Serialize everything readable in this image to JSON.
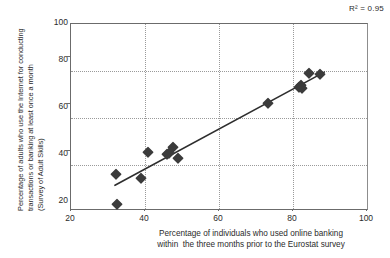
{
  "annotation": {
    "r2_prefix": "R",
    "r2_sup": "2",
    "r2_value": " = 0.95",
    "r2_full": "R² = 0.95"
  },
  "axes": {
    "y_title_lines": [
      "Percentage of adults who use the Internet for conducting",
      "transactions or banking at least once a month",
      "(Survey of Adult Skills)"
    ],
    "x_title_lines": [
      "Percentage of individuals who used online banking",
      "within  the three months prior to the Eurostat survey"
    ],
    "x_ticks": [
      "20",
      "40",
      "60",
      "80",
      "100"
    ],
    "y_ticks": [
      "20",
      "40",
      "60",
      "80",
      "100"
    ]
  },
  "chart_data": {
    "type": "scatter",
    "title": "",
    "subtitle": "",
    "xlabel": "Percentage of individuals who used online banking within  the three months prior to the Eurostat survey",
    "ylabel": "Percentage of adults who use the Internet for conducting transactions or banking at least once a month (Survey of Adult Skills)",
    "xlim": [
      20,
      100
    ],
    "ylim": [
      20,
      100
    ],
    "xticks": [
      20,
      40,
      60,
      80,
      100
    ],
    "yticks": [
      20,
      40,
      60,
      80,
      100
    ],
    "grid": true,
    "grid_style": "dotted",
    "legend": "none",
    "annotations": [
      {
        "text": "R² = 0.95",
        "position": "top-right",
        "r_squared": 0.95
      }
    ],
    "marker": {
      "shape": "diamond",
      "color": "#3b3b3b",
      "size": 7.6
    },
    "series": [
      {
        "name": "Countries",
        "points": [
          {
            "x": 32.3,
            "y": 23.0
          },
          {
            "x": 32.0,
            "y": 35.8
          },
          {
            "x": 38.8,
            "y": 34.3
          },
          {
            "x": 40.7,
            "y": 45.2
          },
          {
            "x": 45.8,
            "y": 44.3
          },
          {
            "x": 46.4,
            "y": 45.0
          },
          {
            "x": 47.3,
            "y": 47.5
          },
          {
            "x": 48.8,
            "y": 42.6
          },
          {
            "x": 72.8,
            "y": 66.0
          },
          {
            "x": 81.3,
            "y": 73.2
          },
          {
            "x": 81.7,
            "y": 74.0
          },
          {
            "x": 82.0,
            "y": 72.8
          },
          {
            "x": 83.8,
            "y": 79.2
          },
          {
            "x": 86.9,
            "y": 78.6
          }
        ]
      }
    ],
    "trendline": {
      "type": "linear",
      "r_squared": 0.95,
      "x_start": 31.8,
      "y_start": 31.0,
      "x_end": 88.0,
      "y_end": 79.4,
      "color": "#2e2e2e",
      "width": 1.6
    }
  }
}
